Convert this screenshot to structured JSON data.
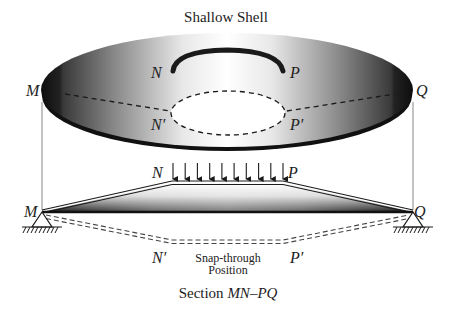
{
  "diagram": {
    "title": "Shallow Shell",
    "shell_labels": {
      "M": "M",
      "Q": "Q",
      "N": "N",
      "P": "P",
      "N_prime": "N′",
      "P_prime": "P′"
    },
    "section_labels": {
      "M": "M",
      "Q": "Q",
      "N": "N",
      "P": "P",
      "N_prime": "N′",
      "P_prime": "P′"
    },
    "snap_through_line1": "Snap-through",
    "snap_through_line2": "Position",
    "section_caption_prefix": "Section ",
    "section_caption_italic": "MN–PQ",
    "load_arrow_count": 10,
    "colors": {
      "ink": "#1a1a1a",
      "shell_dark": "#111111",
      "shell_light": "#ffffff",
      "guide_line": "#888888"
    }
  }
}
